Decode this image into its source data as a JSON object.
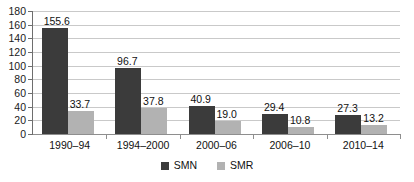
{
  "chart_data": {
    "type": "bar",
    "title": "",
    "xlabel": "",
    "ylabel": "",
    "ylim": [
      0,
      180
    ],
    "yticks": [
      0,
      20,
      40,
      60,
      80,
      100,
      120,
      140,
      160,
      180
    ],
    "grid": true,
    "legend_position": "bottom",
    "categories": [
      "1990–94",
      "1994–2000",
      "2000–06",
      "2006–10",
      "2010–14"
    ],
    "series": [
      {
        "name": "SMN",
        "color": "#3b3b3b",
        "values": [
          155.6,
          96.7,
          40.9,
          29.4,
          27.3
        ],
        "labels": [
          "155.6",
          "96.7",
          "40.9",
          "29.4",
          "27.3"
        ]
      },
      {
        "name": "SMR",
        "color": "#b2b2b2",
        "values": [
          33.7,
          37.8,
          19.0,
          10.8,
          13.2
        ],
        "labels": [
          "33.7",
          "37.8",
          "19.0",
          "10.8",
          "13.2"
        ]
      }
    ]
  },
  "axis": {
    "y_tick_labels": [
      "180",
      "160",
      "140",
      "120",
      "100",
      "80",
      "60",
      "40",
      "20",
      "0"
    ]
  },
  "legend": {
    "items": [
      {
        "label": "SMN",
        "color": "#3b3b3b"
      },
      {
        "label": "SMR",
        "color": "#b2b2b2"
      }
    ]
  },
  "colors": {
    "smn": "#3b3b3b",
    "smr": "#b2b2b2",
    "gridline": "#c9c9c9",
    "axis": "#6e6e6e",
    "text": "#111111",
    "background": "#ffffff"
  }
}
